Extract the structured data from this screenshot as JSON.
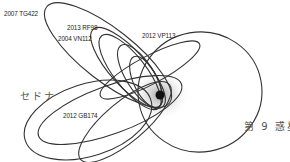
{
  "diagram": {
    "title": "",
    "center_body": "sun",
    "labels": {
      "tg422": "2007 TG422",
      "rf98": "2013 RF98",
      "vn112": "2004 VN112",
      "vp113": "2012 VP113",
      "sedna": "セドナ",
      "gb174": "2012 GB174",
      "planet9": "第 9 惑星"
    },
    "colors": {
      "orbit": "#333333",
      "sun": "#111111",
      "glow": "#bbbbbb",
      "background": "#ffffff"
    }
  }
}
